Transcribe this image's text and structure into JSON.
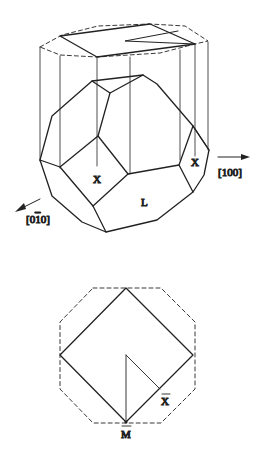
{
  "figure": {
    "top": {
      "labels": {
        "x_front": "X",
        "x_right": "X",
        "l_face": "L",
        "axis_100": "[100]",
        "axis_010": "[0̅0̅]"
      },
      "axis_010_display": "[0",
      "axis_010_bar": "1",
      "axis_010_end": "0]"
    },
    "bottom": {
      "labels": {
        "x_bar": "X",
        "m_bar": "M"
      }
    }
  }
}
